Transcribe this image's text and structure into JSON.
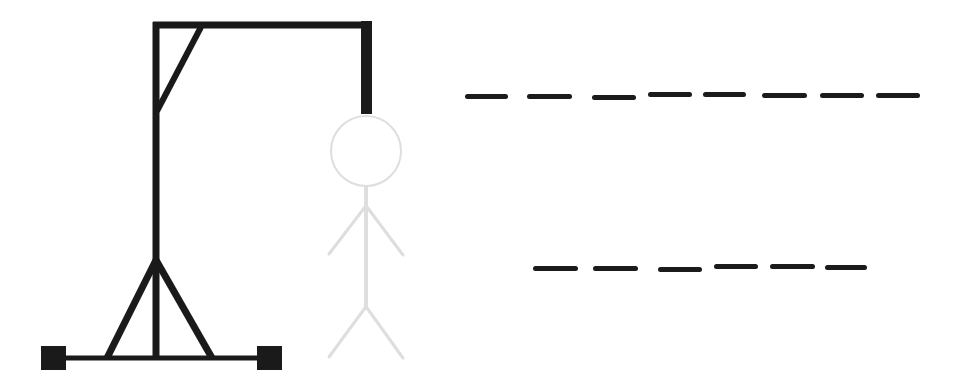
{
  "game": {
    "name": "Hangman",
    "colors": {
      "gallows": "#1a1a1a",
      "figure": "#dedede",
      "blank": "#1b1b1b",
      "background": "#ffffff"
    },
    "gallows": {
      "pole_x": 156,
      "beam_y": 25,
      "rope_x": 366,
      "rope_bottom_y": 114,
      "base_y": 358
    },
    "figure": {
      "visible_parts": [
        "head",
        "body",
        "left-arm",
        "right-arm",
        "left-leg",
        "right-leg"
      ],
      "state": "faded",
      "head": {
        "cx": 366,
        "cy": 151,
        "r": 35
      }
    },
    "word": {
      "rows": [
        {
          "letters": [
            "",
            "",
            "",
            "",
            "",
            "",
            "",
            ""
          ],
          "length": 8,
          "blanks_x": [
            [
              465,
              508
            ],
            [
              527,
              572
            ],
            [
              592,
              636
            ],
            [
              648,
              692
            ],
            [
              703,
              746
            ],
            [
              762,
              807
            ],
            [
              820,
              864
            ],
            [
              876,
              920
            ]
          ],
          "y": 93
        },
        {
          "letters": [
            "",
            "",
            "",
            "",
            "",
            ""
          ],
          "length": 6,
          "blanks_x": [
            [
              533,
              578
            ],
            [
              593,
              638
            ],
            [
              658,
              702
            ],
            [
              714,
              758
            ],
            [
              770,
              815
            ],
            [
              825,
              867
            ]
          ],
          "y": 265
        }
      ]
    }
  }
}
